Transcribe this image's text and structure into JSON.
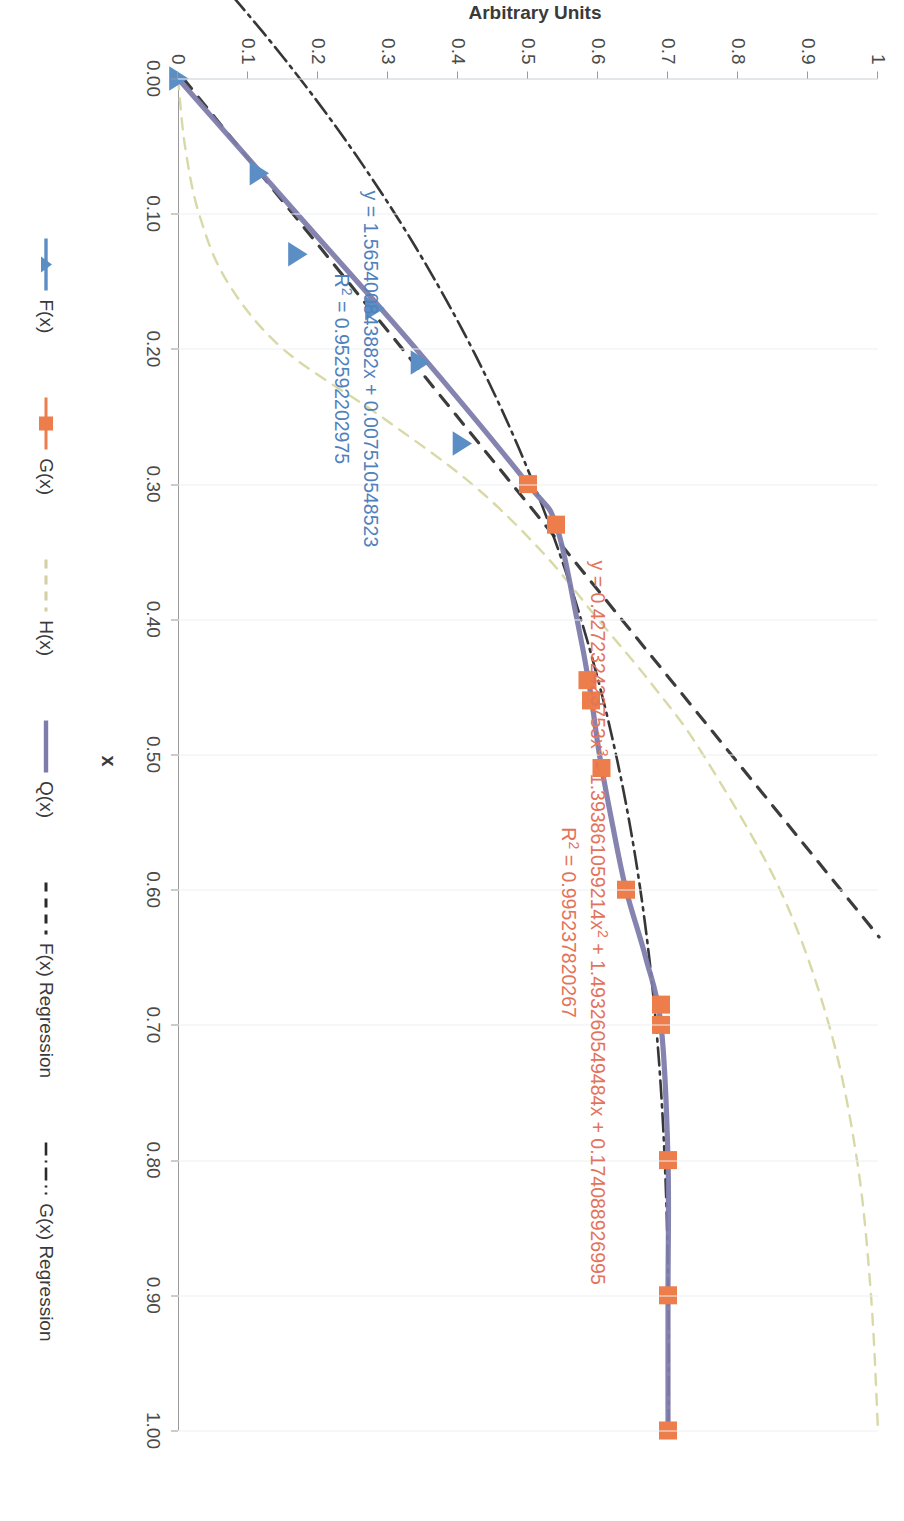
{
  "chart_data": {
    "type": "line",
    "title": "",
    "xlabel": "x",
    "ylabel": "Arbitrary Units",
    "xlim": [
      0.0,
      1.0
    ],
    "ylim": [
      0.0,
      1.0
    ],
    "grid": true,
    "legend_position": "bottom",
    "x_ticks": [
      "0.00",
      "0.10",
      "0.20",
      "0.30",
      "0.40",
      "0.50",
      "0.60",
      "0.70",
      "0.80",
      "0.90",
      "1.00"
    ],
    "x_tick_values": [
      0.0,
      0.1,
      0.2,
      0.3,
      0.4,
      0.5,
      0.6,
      0.7,
      0.8,
      0.9,
      1.0
    ],
    "y_ticks": [
      "0",
      "0.1",
      "0.2",
      "0.3",
      "0.4",
      "0.5",
      "0.6",
      "0.7",
      "0.8",
      "0.9",
      "1"
    ],
    "y_tick_values": [
      0.0,
      0.1,
      0.2,
      0.3,
      0.4,
      0.5,
      0.6,
      0.7,
      0.8,
      0.9,
      1.0
    ],
    "series": [
      {
        "name": "F(x)",
        "marker": "triangle",
        "color": "#5b8ec4",
        "style": "markers",
        "x": [
          0.0,
          0.07,
          0.13,
          0.17,
          0.21,
          0.27
        ],
        "y": [
          0.0,
          0.115,
          0.17,
          0.28,
          0.345,
          0.405
        ]
      },
      {
        "name": "G(x)",
        "marker": "square",
        "color": "#ed7d4a",
        "style": "markers",
        "x": [
          0.0,
          0.3,
          0.33,
          0.445,
          0.46,
          0.51,
          0.6,
          0.685,
          0.7,
          0.8,
          0.9,
          1.0
        ],
        "y": [
          0.0,
          0.5,
          0.54,
          0.585,
          0.59,
          0.605,
          0.64,
          0.69,
          0.69,
          0.7,
          0.7,
          0.7
        ]
      },
      {
        "name": "H(x)",
        "marker": "none",
        "color": "#d9d9a8",
        "style": "dashed",
        "x": [
          0.0,
          0.05,
          0.1,
          0.15,
          0.2,
          0.25,
          0.3,
          0.35,
          0.4,
          0.45,
          0.5,
          0.6,
          0.7,
          0.8,
          0.9,
          1.0
        ],
        "y": [
          0.0,
          0.01,
          0.03,
          0.07,
          0.15,
          0.29,
          0.42,
          0.52,
          0.6,
          0.68,
          0.75,
          0.86,
          0.93,
          0.97,
          0.99,
          1.0
        ]
      },
      {
        "name": "Q(x)",
        "marker": "none",
        "color": "#7e7cab",
        "style": "solid",
        "x": [
          0.0,
          0.1,
          0.2,
          0.3,
          0.33,
          0.4,
          0.45,
          0.5,
          0.55,
          0.6,
          0.65,
          0.7,
          0.8,
          0.9,
          1.0
        ],
        "y": [
          0.0,
          0.17,
          0.34,
          0.5,
          0.54,
          0.57,
          0.588,
          0.602,
          0.62,
          0.64,
          0.668,
          0.69,
          0.7,
          0.7,
          0.7
        ]
      },
      {
        "name": "F(x) Regression",
        "marker": "none",
        "color": "#2b2b2b",
        "style": "dashed",
        "fit": "linear",
        "slope": 1.565400843882,
        "intercept": 0.007510548523,
        "r2": 0.952592202975
      },
      {
        "name": "G(x) Regression",
        "marker": "none",
        "color": "#2b2b2b",
        "style": "dash-dot",
        "fit": "cubic",
        "coefficients": [
          0.427232423753,
          -1.393861059214,
          1.493260549484,
          0.174088926995
        ],
        "r2": 0.995237820267
      }
    ],
    "annotations": [
      {
        "id": "cubic-fit",
        "color": "#e3735a",
        "line1_pre": "y = 0.427232423753x",
        "line1_sup1": "3",
        "line1_mid": " - 1.393861059214x",
        "line1_sup2": "2",
        "line1_post": " + 1.493260549484x + 0.174088926995",
        "line2_pre": "R",
        "line2_sup": "2",
        "line2_post": " = 0.995237820267"
      },
      {
        "id": "linear-fit",
        "color": "#4f81bd",
        "line1": "y = 1.565400843882x + 0.007510548523",
        "line2_pre": "R",
        "line2_sup": "2",
        "line2_post": " = 0.952592202975"
      }
    ]
  },
  "legend": {
    "items": [
      {
        "label": "F(x)",
        "key": "line-marker-triangle-icon",
        "color": "#5b8ec4"
      },
      {
        "label": "G(x)",
        "key": "line-marker-square-icon",
        "color": "#ed7d4a"
      },
      {
        "label": "H(x)",
        "key": "dashed-line-icon",
        "color": "#d0d0a0"
      },
      {
        "label": "Q(x)",
        "key": "solid-line-icon",
        "color": "#7e7cab"
      },
      {
        "label": "F(x) Regression",
        "key": "dashed-line-icon",
        "color": "#2b2b2b"
      },
      {
        "label": "G(x) Regression",
        "key": "dash-dot-line-icon",
        "color": "#2b2b2b"
      }
    ]
  },
  "axes": {
    "x_title": "x",
    "y_title": "Arbitrary Units"
  }
}
